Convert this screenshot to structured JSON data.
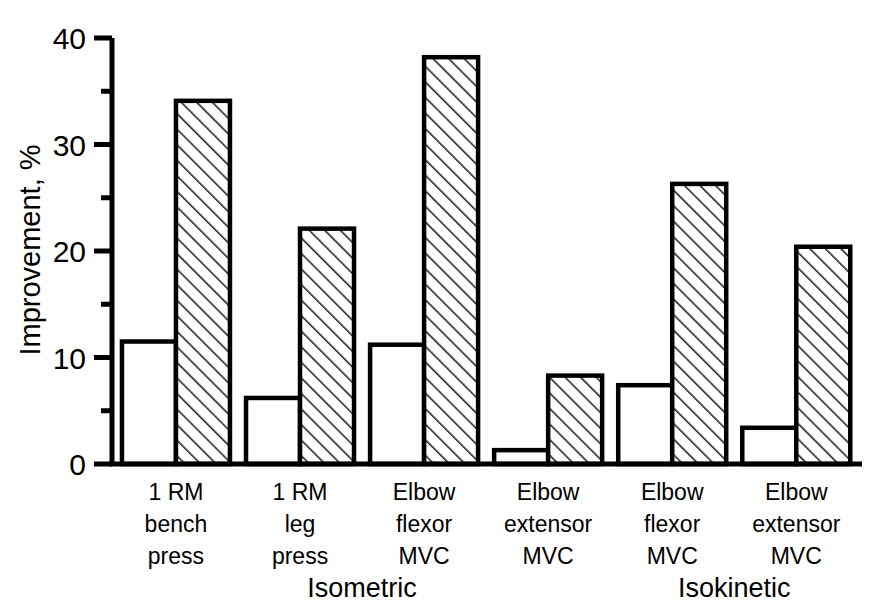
{
  "chart_data": {
    "type": "bar",
    "title": "",
    "xlabel": "",
    "ylabel": "Improvement, %",
    "ylim": [
      0,
      40
    ],
    "yticks": [
      0,
      10,
      20,
      30,
      40
    ],
    "ytick_labels": [
      "0",
      "10",
      "20",
      "30",
      "40"
    ],
    "yminor_ticks": [
      5,
      15,
      25,
      35
    ],
    "grid": false,
    "legend_position": "none",
    "categories": [
      "1 RM bench press",
      "1 RM leg press",
      "Elbow flexor MVC",
      "Elbow extensor MVC",
      "Elbow flexor MVC",
      "Elbow extensor MVC"
    ],
    "category_lines": [
      [
        "1 RM",
        "bench",
        "press"
      ],
      [
        "1 RM",
        "leg",
        "press"
      ],
      [
        "Elbow",
        "flexor",
        "MVC"
      ],
      [
        "Elbow",
        "extensor",
        "MVC"
      ],
      [
        "Elbow",
        "flexor",
        "MVC"
      ],
      [
        "Elbow",
        "extensor",
        "MVC"
      ]
    ],
    "series": [
      {
        "name": "open",
        "style": "open",
        "values": [
          11.5,
          6.2,
          11.2,
          1.3,
          7.4,
          3.4
        ]
      },
      {
        "name": "hatched",
        "style": "hatched",
        "values": [
          34.1,
          22.1,
          38.2,
          8.3,
          26.3,
          20.4
        ]
      }
    ],
    "group_spans": [
      {
        "label": "Isometric",
        "categories": [
          0,
          1,
          2,
          3
        ]
      },
      {
        "label": "Isokinetic",
        "categories": [
          4,
          5
        ]
      }
    ],
    "colors": {
      "axis": "#000000",
      "bar_edge": "#000000",
      "bar_open_fill": "#ffffff",
      "bar_hatch": "#000000",
      "background": "#ffffff"
    }
  }
}
